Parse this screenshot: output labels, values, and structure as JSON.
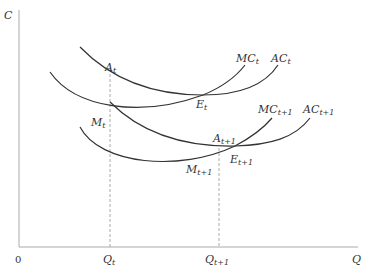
{
  "figure": {
    "axes": {
      "y_label": "C",
      "x_label": "Q",
      "origin_label": "0",
      "color": "#aaaaaa"
    },
    "x_ticks": [
      {
        "base": "Q",
        "sub": "t"
      },
      {
        "base": "Q",
        "sub": "t+1"
      }
    ],
    "curves": [
      {
        "name": "MC",
        "sub": "t"
      },
      {
        "name": "AC",
        "sub": "t"
      },
      {
        "name": "MC",
        "sub": "t+1"
      },
      {
        "name": "AC",
        "sub": "t+1"
      }
    ],
    "points": [
      {
        "base": "A",
        "sub": "t"
      },
      {
        "base": "E",
        "sub": "t"
      },
      {
        "base": "M",
        "sub": "t"
      },
      {
        "base": "A",
        "sub": "t+1"
      },
      {
        "base": "E",
        "sub": "t+1"
      },
      {
        "base": "M",
        "sub": "t+1"
      }
    ],
    "curve_color": "#333333",
    "dash_color": "#aaaaaa"
  }
}
